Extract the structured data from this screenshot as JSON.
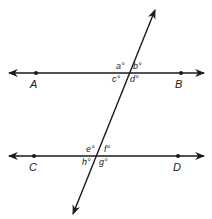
{
  "diagram": {
    "color": "#1a1a1a",
    "lines": [
      {
        "name": "AB",
        "points": [
          "A",
          "B"
        ]
      },
      {
        "name": "CD",
        "points": [
          "C",
          "D"
        ]
      },
      {
        "name": "transversal"
      }
    ],
    "points": {
      "A": "A",
      "B": "B",
      "C": "C",
      "D": "D"
    },
    "angles": {
      "a": "a°",
      "b": "b°",
      "c": "c°",
      "d": "d°",
      "e": "e°",
      "f": "f°",
      "g": "g°",
      "h": "h°"
    }
  }
}
